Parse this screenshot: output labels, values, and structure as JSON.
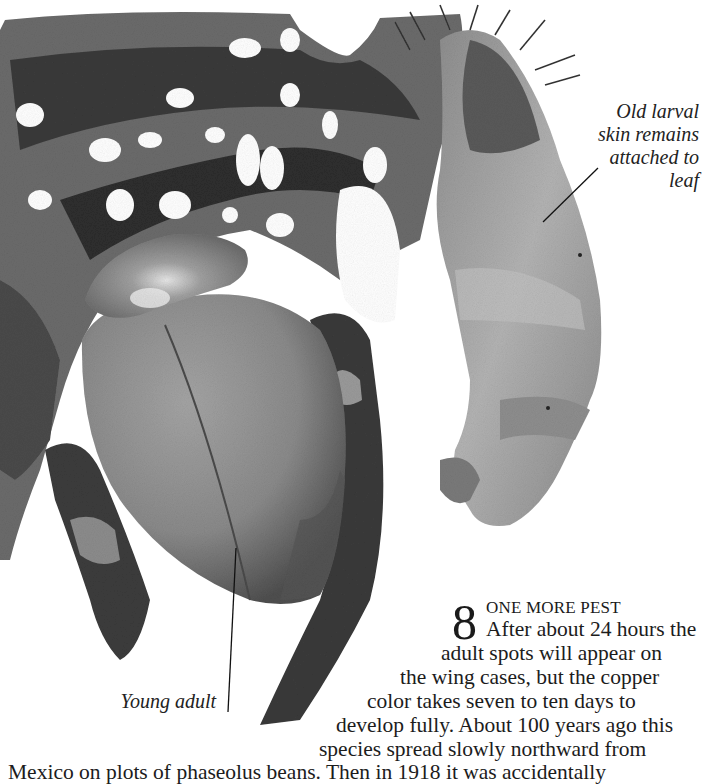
{
  "figure": {
    "palette": {
      "background": "#ffffff",
      "leaf_dark": "#2b2b2b",
      "leaf_mid": "#6e6e6e",
      "beetle_body": "#8a8a8a",
      "beetle_shadow": "#4e4e4e",
      "larva_skin": "#a9a9a9",
      "text": "#1a1a1a"
    }
  },
  "captions": {
    "larval_skin": [
      "Old larval",
      "skin remains",
      "attached to",
      "leaf"
    ],
    "young_adult": "Young adult"
  },
  "step": {
    "number": "8",
    "heading": "ONE MORE PEST",
    "lines": [
      "After about 24 hours the",
      "adult spots will appear on",
      "the wing cases, but the copper",
      "color takes seven to ten days to",
      "develop fully. About 100 years ago this",
      "species spread slowly northward from",
      "Mexico on plots of phaseolus beans. Then in 1918 it was accidentally"
    ]
  }
}
